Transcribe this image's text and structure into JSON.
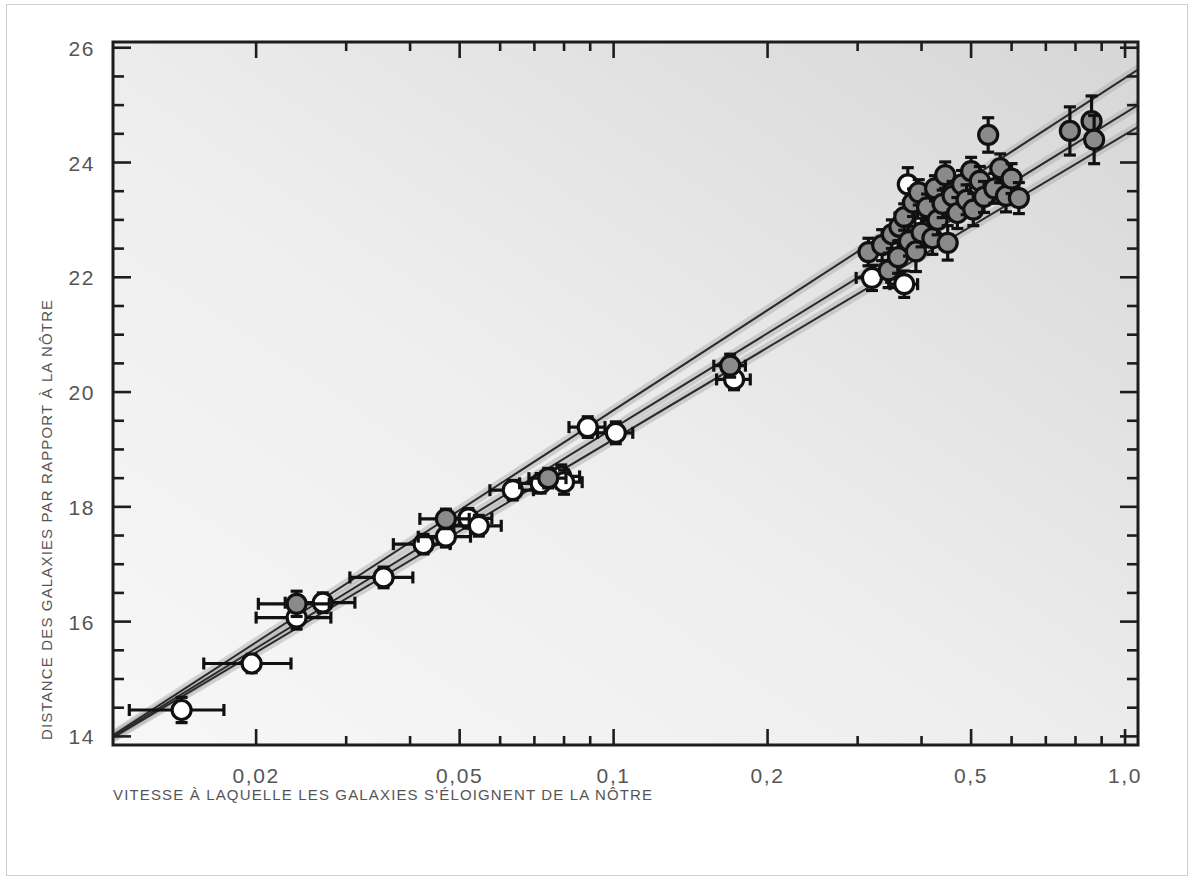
{
  "figure": {
    "background_color": "#ffffff",
    "plot_bg_light": "#f4f4f4",
    "plot_bg_dark": "#d8d8d8",
    "frame_color": "#cfcfcf",
    "axis_color": "#1d1d1d",
    "marker_open_fill": "#ffffff",
    "marker_filled_fill": "#8a8a8a",
    "marker_stroke": "#111111",
    "band_color": "#b3b3b3",
    "line_color": "#2a2a2a"
  },
  "chart_data": {
    "type": "scatter",
    "title": "",
    "xlabel": "VITESSE À LAQUELLE LES GALAXIES S'ÉLOIGNENT DE LA NÔTRE",
    "ylabel": "DISTANCE DES GALAXIES PAR RAPPORT À LA NÔTRE",
    "xscale": "log",
    "yscale": "linear",
    "xlim": [
      0.0105,
      1.06
    ],
    "ylim": [
      13.85,
      26.1
    ],
    "grid": false,
    "legend_position": "none",
    "xticks": [
      0.02,
      0.05,
      0.1,
      0.2,
      0.5,
      1.0
    ],
    "xticklabels": [
      "0,02",
      "0,05",
      "0,1",
      "0,2",
      "0,5",
      "1,0"
    ],
    "xminorticks": [
      0.03,
      0.04,
      0.06,
      0.07,
      0.08,
      0.09,
      0.3,
      0.4,
      0.6,
      0.7,
      0.8,
      0.9
    ],
    "yticks": [
      14,
      16,
      18,
      20,
      22,
      24,
      26
    ],
    "yticklabels": [
      "14",
      "16",
      "18",
      "20",
      "22",
      "24",
      "26"
    ],
    "yminorticks": [
      14.5,
      15,
      15.5,
      16.5,
      17,
      17.5,
      18.5,
      19,
      19.5,
      20.5,
      21,
      21.5,
      22.5,
      23,
      23.5,
      24.5,
      25,
      25.5
    ],
    "series": [
      {
        "name": "open-circles",
        "marker": "open-circle",
        "points": [
          {
            "x": 0.0143,
            "y": 14.46,
            "xerr": 0.003,
            "yerr": 0.22
          },
          {
            "x": 0.0196,
            "y": 15.27,
            "xerr": 0.0038,
            "yerr": 0.16
          },
          {
            "x": 0.024,
            "y": 16.07,
            "xerr": 0.004,
            "yerr": 0.2
          },
          {
            "x": 0.027,
            "y": 16.33,
            "xerr": 0.0042,
            "yerr": 0.17
          },
          {
            "x": 0.0355,
            "y": 16.77,
            "xerr": 0.005,
            "yerr": 0.18
          },
          {
            "x": 0.0425,
            "y": 17.35,
            "xerr": 0.0054,
            "yerr": 0.17
          },
          {
            "x": 0.047,
            "y": 17.48,
            "xerr": 0.0055,
            "yerr": 0.18
          },
          {
            "x": 0.052,
            "y": 17.8,
            "xerr": 0.0058,
            "yerr": 0.17
          },
          {
            "x": 0.0545,
            "y": 17.67,
            "xerr": 0.0058,
            "yerr": 0.18
          },
          {
            "x": 0.0635,
            "y": 18.29,
            "xerr": 0.0062,
            "yerr": 0.17
          },
          {
            "x": 0.072,
            "y": 18.41,
            "xerr": 0.0065,
            "yerr": 0.17
          },
          {
            "x": 0.079,
            "y": 18.53,
            "xerr": 0.0068,
            "yerr": 0.2
          },
          {
            "x": 0.08,
            "y": 18.43,
            "xerr": 0.0068,
            "yerr": 0.21
          },
          {
            "x": 0.089,
            "y": 19.39,
            "xerr": 0.0072,
            "yerr": 0.18
          },
          {
            "x": 0.101,
            "y": 19.29,
            "xerr": 0.008,
            "yerr": 0.19
          },
          {
            "x": 0.172,
            "y": 20.22,
            "xerr": 0.013,
            "yerr": 0.18
          },
          {
            "x": 0.32,
            "y": 21.99,
            "xerr": 0.022,
            "yerr": 0.22
          },
          {
            "x": 0.37,
            "y": 21.88,
            "xerr": 0.023,
            "yerr": 0.23
          },
          {
            "x": 0.376,
            "y": 23.62,
            "xerr": 0.0,
            "yerr": 0.29
          },
          {
            "x": 0.405,
            "y": 22.97,
            "xerr": 0.0,
            "yerr": 0.26
          }
        ]
      },
      {
        "name": "filled-circles",
        "marker": "filled-circle",
        "points": [
          {
            "x": 0.024,
            "y": 16.31,
            "xerr": 0.0038,
            "yerr": 0.22
          },
          {
            "x": 0.047,
            "y": 17.79,
            "xerr": 0.0052,
            "yerr": 0.17
          },
          {
            "x": 0.0745,
            "y": 18.5,
            "xerr": 0.0062,
            "yerr": 0.17
          },
          {
            "x": 0.169,
            "y": 20.46,
            "xerr": 0.012,
            "yerr": 0.2
          },
          {
            "x": 0.315,
            "y": 22.44,
            "xerr": 0.0,
            "yerr": 0.24
          },
          {
            "x": 0.335,
            "y": 22.56,
            "xerr": 0.0,
            "yerr": 0.27
          },
          {
            "x": 0.345,
            "y": 22.12,
            "xerr": 0.0,
            "yerr": 0.3
          },
          {
            "x": 0.35,
            "y": 22.75,
            "xerr": 0.0,
            "yerr": 0.25
          },
          {
            "x": 0.36,
            "y": 22.35,
            "xerr": 0.0,
            "yerr": 0.28
          },
          {
            "x": 0.362,
            "y": 22.88,
            "xerr": 0.0,
            "yerr": 0.24
          },
          {
            "x": 0.37,
            "y": 23.05,
            "xerr": 0.0,
            "yerr": 0.23
          },
          {
            "x": 0.378,
            "y": 22.63,
            "xerr": 0.0,
            "yerr": 0.26
          },
          {
            "x": 0.385,
            "y": 23.3,
            "xerr": 0.0,
            "yerr": 0.24
          },
          {
            "x": 0.39,
            "y": 22.45,
            "xerr": 0.0,
            "yerr": 0.35
          },
          {
            "x": 0.395,
            "y": 23.48,
            "xerr": 0.0,
            "yerr": 0.22
          },
          {
            "x": 0.4,
            "y": 22.78,
            "xerr": 0.0,
            "yerr": 0.25
          },
          {
            "x": 0.41,
            "y": 23.22,
            "xerr": 0.0,
            "yerr": 0.23
          },
          {
            "x": 0.42,
            "y": 22.68,
            "xerr": 0.0,
            "yerr": 0.28
          },
          {
            "x": 0.425,
            "y": 23.55,
            "xerr": 0.0,
            "yerr": 0.22
          },
          {
            "x": 0.43,
            "y": 23.0,
            "xerr": 0.0,
            "yerr": 0.26
          },
          {
            "x": 0.44,
            "y": 23.28,
            "xerr": 0.0,
            "yerr": 0.24
          },
          {
            "x": 0.445,
            "y": 23.78,
            "xerr": 0.0,
            "yerr": 0.23
          },
          {
            "x": 0.45,
            "y": 22.6,
            "xerr": 0.0,
            "yerr": 0.3
          },
          {
            "x": 0.46,
            "y": 23.42,
            "xerr": 0.0,
            "yerr": 0.25
          },
          {
            "x": 0.47,
            "y": 23.12,
            "xerr": 0.0,
            "yerr": 0.27
          },
          {
            "x": 0.48,
            "y": 23.62,
            "xerr": 0.0,
            "yerr": 0.24
          },
          {
            "x": 0.49,
            "y": 23.35,
            "xerr": 0.0,
            "yerr": 0.26
          },
          {
            "x": 0.5,
            "y": 23.85,
            "xerr": 0.0,
            "yerr": 0.24
          },
          {
            "x": 0.505,
            "y": 23.18,
            "xerr": 0.0,
            "yerr": 0.28
          },
          {
            "x": 0.52,
            "y": 23.68,
            "xerr": 0.0,
            "yerr": 0.25
          },
          {
            "x": 0.53,
            "y": 23.4,
            "xerr": 0.0,
            "yerr": 0.27
          },
          {
            "x": 0.54,
            "y": 24.48,
            "xerr": 0.0,
            "yerr": 0.3
          },
          {
            "x": 0.555,
            "y": 23.55,
            "xerr": 0.0,
            "yerr": 0.26
          },
          {
            "x": 0.57,
            "y": 23.9,
            "xerr": 0.0,
            "yerr": 0.25
          },
          {
            "x": 0.585,
            "y": 23.42,
            "xerr": 0.0,
            "yerr": 0.28
          },
          {
            "x": 0.6,
            "y": 23.72,
            "xerr": 0.0,
            "yerr": 0.26
          },
          {
            "x": 0.62,
            "y": 23.38,
            "xerr": 0.0,
            "yerr": 0.27
          },
          {
            "x": 0.78,
            "y": 24.55,
            "xerr": 0.0,
            "yerr": 0.42
          },
          {
            "x": 0.86,
            "y": 24.72,
            "xerr": 0.0,
            "yerr": 0.44
          },
          {
            "x": 0.87,
            "y": 24.4,
            "xerr": 0.0,
            "yerr": 0.42
          }
        ]
      }
    ],
    "fit_lines": [
      {
        "name": "model-upper",
        "y_at_xmin": 14.02,
        "y_at_xmax": 25.62
      },
      {
        "name": "model-middle",
        "y_at_xmin": 14.0,
        "y_at_xmax": 25.0
      },
      {
        "name": "model-lower",
        "y_at_xmin": 13.98,
        "y_at_xmax": 24.62
      }
    ],
    "confidence_band": {
      "name": "confidence-band",
      "half_width_mag": 0.1
    }
  }
}
